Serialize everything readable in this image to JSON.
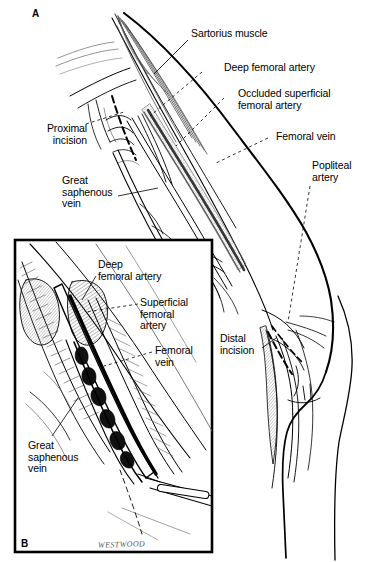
{
  "figure": {
    "background_color": "#ffffff",
    "ink_color": "#000000",
    "width": 375,
    "height": 562
  },
  "panels": [
    {
      "id": "A",
      "letter": "A"
    },
    {
      "id": "B",
      "letter": "B"
    }
  ],
  "panel_a": {
    "letter": "A",
    "labels": {
      "sartorius_muscle": "Sartorius muscle",
      "deep_femoral_artery": "Deep femoral artery",
      "occluded_superficial_femoral_artery": "Occluded superficial\nfemoral artery",
      "femoral_vein": "Femoral vein",
      "popliteal_artery": "Popliteal\nartery",
      "proximal_incision": "Proximal\nincision",
      "great_saphenous_vein": "Great\nsaphenous\nvein",
      "distal_incision": "Distal\nincision"
    }
  },
  "panel_b": {
    "letter": "B",
    "labels": {
      "deep_femoral_artery": "Deep\nfemoral artery",
      "superficial_femoral_artery": "Superficial\nfemoral\nartery",
      "femoral_vein": "Femoral\nvein",
      "great_saphenous_vein": "Great\nsaphenous\nvein"
    },
    "signature": "WESTWOOD"
  }
}
